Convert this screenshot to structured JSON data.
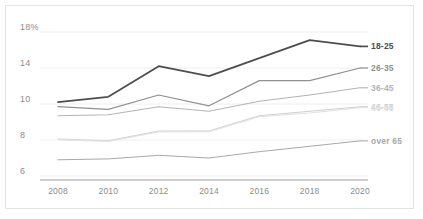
{
  "chart_data": {
    "type": "line",
    "title": "",
    "xlabel": "",
    "ylabel": "",
    "x": [
      2008,
      2010,
      2012,
      2014,
      2016,
      2018,
      2020
    ],
    "xtick_labels": [
      "2008",
      "2010",
      "2012",
      "2014",
      "2016",
      "2018",
      "2020"
    ],
    "ytick_labels": [
      "18%",
      "14",
      "10",
      "8",
      "6"
    ],
    "ytick_values": [
      18,
      14,
      10,
      8,
      6
    ],
    "ylim": [
      6,
      18
    ],
    "grid": true,
    "legend_position": "right-inline-end-of-line",
    "series": [
      {
        "name": "18-25",
        "label": "18-25",
        "color": "#4d4d4d",
        "width": 1.7,
        "values": [
          10.2,
          10.8,
          14.2,
          13.1,
          15.1,
          17.1,
          16.4
        ]
      },
      {
        "name": "26-35",
        "label": "26-35",
        "color": "#909090",
        "width": 1.2,
        "values": [
          9.85,
          9.7,
          11.0,
          9.9,
          12.6,
          12.6,
          14.0
        ]
      },
      {
        "name": "36-45",
        "label": "36-45",
        "color": "#b4b4b4",
        "width": 1.1,
        "values": [
          9.35,
          9.4,
          9.85,
          9.6,
          10.3,
          11.0,
          11.8
        ]
      },
      {
        "name": "46-55",
        "label": "46-55",
        "color": "#cfcfcf",
        "width": 1.1,
        "values": [
          8.05,
          7.95,
          8.5,
          8.5,
          9.35,
          9.6,
          9.85
        ]
      },
      {
        "name": "56-65",
        "label": "56-65",
        "color": "#e2e2e2",
        "width": 1.1,
        "values": [
          8.02,
          7.92,
          8.45,
          8.46,
          9.3,
          9.5,
          9.8
        ]
      },
      {
        "name": "over 65",
        "label": "over 65",
        "color": "#a8a8a8",
        "width": 1.0,
        "values": [
          6.9,
          6.95,
          7.15,
          7.0,
          7.35,
          7.65,
          7.95
        ]
      }
    ]
  },
  "axis": {
    "axis_line_color": "#9a9a9a",
    "grid_color": "#eeeeee",
    "tick_text_color": "#8c8c8c"
  },
  "frame": {
    "border_color": "#e3e3e3",
    "background": "#ffffff"
  }
}
